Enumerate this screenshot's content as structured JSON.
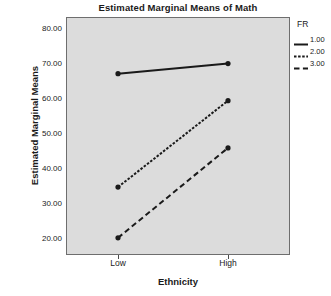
{
  "chart_data": {
    "type": "line",
    "title": "Estimated Marginal Means of Math",
    "xlabel": "Ethnicity",
    "ylabel": "Estimated Marginal Means",
    "categories": [
      "Low",
      "High"
    ],
    "ylim": [
      15.5,
      83.5
    ],
    "yticks": [
      20,
      30,
      40,
      50,
      60,
      70,
      80
    ],
    "ytick_labels": [
      "20.00",
      "30.00",
      "40.00",
      "50.00",
      "60.00",
      "70.00",
      "80.00"
    ],
    "grid": false,
    "legend_position": "right",
    "legend_title": "FR",
    "series": [
      {
        "name": "1.00",
        "values": [
          67.3,
          70.2
        ],
        "style": "solid",
        "dasharray": "none",
        "color": "#1a1a1a"
      },
      {
        "name": "2.00",
        "values": [
          34.9,
          59.6
        ],
        "style": "dashed-short",
        "dasharray": "2.5,1.6",
        "color": "#1a1a1a"
      },
      {
        "name": "3.00",
        "values": [
          20.4,
          46.1
        ],
        "style": "dashed-long",
        "dasharray": "5.5,3.4",
        "color": "#1a1a1a"
      }
    ]
  },
  "style": {
    "panel_background": "#dcdcdc",
    "panel_border": "#6e6e6e",
    "text_color": "#1a1a1a",
    "page_background": "#ffffff"
  }
}
